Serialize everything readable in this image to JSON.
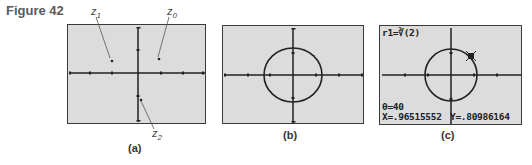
{
  "figure": {
    "label": "Figure 42"
  },
  "panels": [
    {
      "id": "a",
      "caption": "(a)",
      "annotations": [
        {
          "name": "z1",
          "base": "z",
          "sub": "1"
        },
        {
          "name": "z0",
          "base": "z",
          "sub": "0"
        },
        {
          "name": "z2",
          "base": "z",
          "sub": "2"
        }
      ]
    },
    {
      "id": "b",
      "caption": "(b)"
    },
    {
      "id": "c",
      "caption": "(c)",
      "equation": "r1=∛(2)",
      "theta": "θ=40",
      "x_readout": "X=.96515552",
      "y_readout": "Y=.80986164"
    }
  ],
  "colors": {
    "screen_bg": "#dcdcdc",
    "ink": "#222222",
    "frame": "#3a3a3a"
  }
}
